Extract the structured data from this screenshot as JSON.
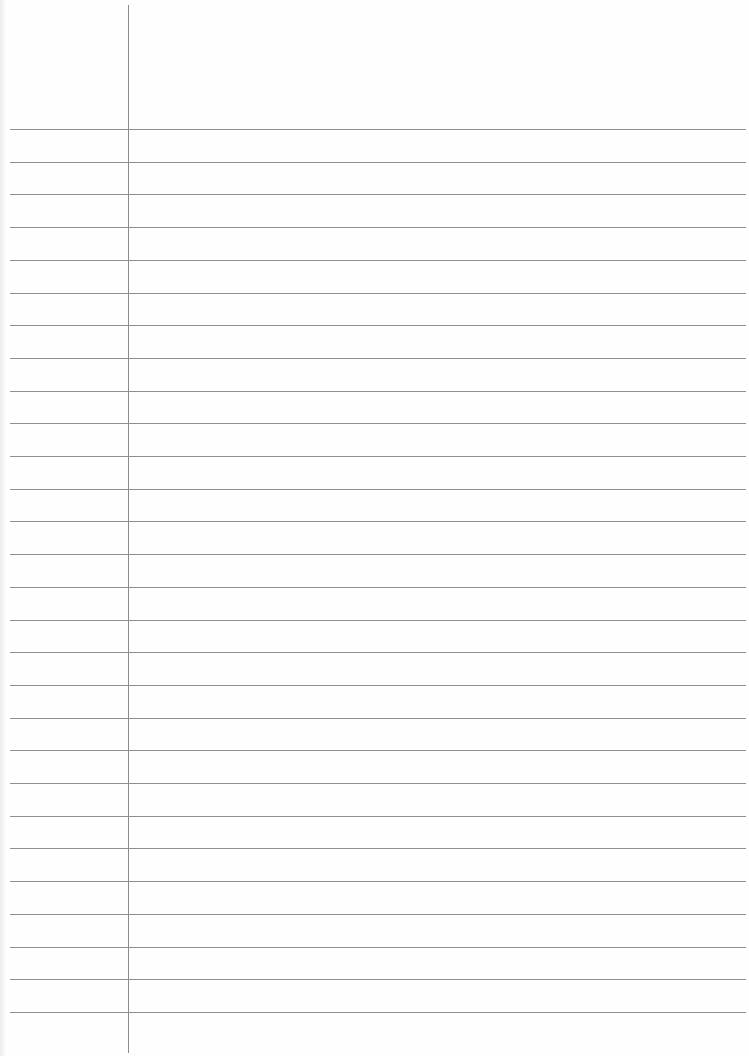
{
  "paper": {
    "type": "lined-paper",
    "background_color": "#fefefe",
    "line_color": "#8e8e8e",
    "margin_line_color": "#8c8c8c",
    "margin_line_x": 128,
    "first_rule_y": 129,
    "rule_spacing": 32.7,
    "rule_count": 28,
    "rule_left": 10,
    "rule_right": 746
  }
}
